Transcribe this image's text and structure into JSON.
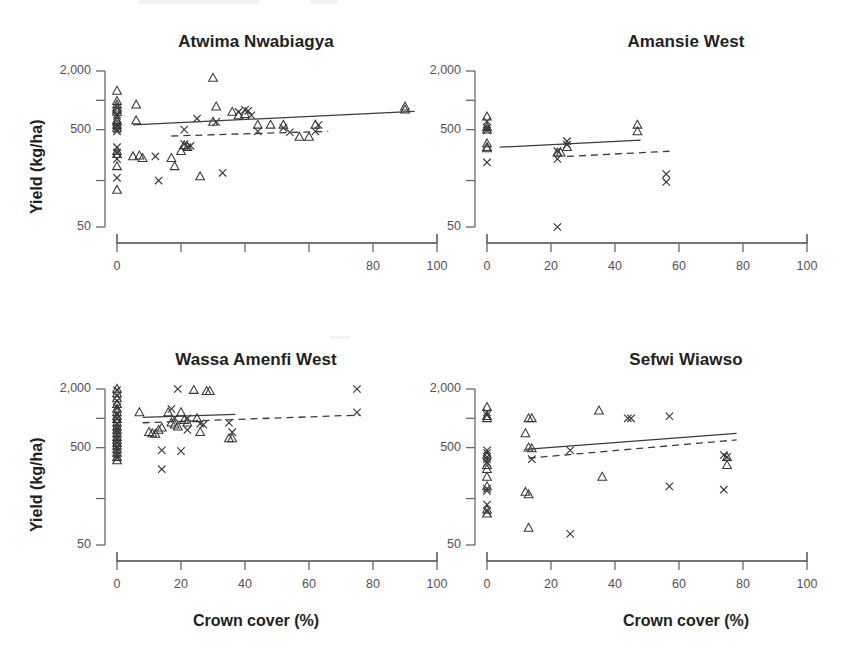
{
  "figure": {
    "axis_labels": {
      "y": "Yield (kg/ha)",
      "x": "Crown cover (%)"
    },
    "y_ticks": [
      {
        "value": 2000,
        "label": "2,000",
        "labeled": true
      },
      {
        "value": 1000,
        "label": "",
        "labeled": false
      },
      {
        "value": 500,
        "label": "500",
        "labeled": true
      },
      {
        "value": 150,
        "label": "",
        "labeled": false
      },
      {
        "value": 50,
        "label": "50",
        "labeled": true
      }
    ],
    "x_ticks": [
      0,
      20,
      40,
      60,
      80,
      100
    ],
    "legend_note": "",
    "colors": {
      "ink": "#3a3737",
      "axis": "#4a4646",
      "tick_text": "#555152",
      "title": "#231f20"
    }
  },
  "chart_data": [
    {
      "type": "scatter",
      "panel": 1,
      "title": "Atwima Nwabiagya",
      "xlabel": "",
      "ylabel": "Yield (kg/ha)",
      "xlim": [
        0,
        100
      ],
      "ylim": [
        50,
        2000
      ],
      "yscale": "log",
      "grid": false,
      "legend": "none",
      "x_tick_labels": [
        "0",
        "",
        "",
        "",
        "80",
        "100"
      ],
      "series": [
        {
          "name": "triangle",
          "marker": "triangle",
          "points": [
            [
              0,
              1250
            ],
            [
              0,
              980
            ],
            [
              0,
              900
            ],
            [
              0,
              840
            ],
            [
              0,
              800
            ],
            [
              0,
              760
            ],
            [
              0,
              620
            ],
            [
              0,
              600
            ],
            [
              0,
              560
            ],
            [
              0,
              520
            ],
            [
              0,
              300
            ],
            [
              0,
              280
            ],
            [
              0,
              210
            ],
            [
              0,
              120
            ],
            [
              6,
              900
            ],
            [
              6,
              620
            ],
            [
              5,
              265
            ],
            [
              7,
              270
            ],
            [
              8,
              255
            ],
            [
              17,
              255
            ],
            [
              18,
              210
            ],
            [
              21,
              345
            ],
            [
              22,
              330
            ],
            [
              20,
              300
            ],
            [
              26,
              165
            ],
            [
              30,
              600
            ],
            [
              30,
              1700
            ],
            [
              31,
              860
            ],
            [
              36,
              760
            ],
            [
              38,
              700
            ],
            [
              40,
              720
            ],
            [
              44,
              560
            ],
            [
              48,
              560
            ],
            [
              52,
              560
            ],
            [
              57,
              420
            ],
            [
              60,
              420
            ],
            [
              62,
              560
            ],
            [
              90,
              860
            ],
            [
              90,
              800
            ]
          ]
        },
        {
          "name": "cross",
          "marker": "cross",
          "points": [
            [
              0,
              720
            ],
            [
              0,
              690
            ],
            [
              0,
              560
            ],
            [
              0,
              540
            ],
            [
              0,
              500
            ],
            [
              0,
              480
            ],
            [
              0,
              330
            ],
            [
              0,
              290
            ],
            [
              0,
              250
            ],
            [
              0,
              160
            ],
            [
              12,
              265
            ],
            [
              13,
              150
            ],
            [
              21,
              500
            ],
            [
              21,
              355
            ],
            [
              22,
              330
            ],
            [
              23,
              340
            ],
            [
              25,
              650
            ],
            [
              31,
              600
            ],
            [
              33,
              180
            ],
            [
              38,
              760
            ],
            [
              40,
              800
            ],
            [
              41,
              780
            ],
            [
              42,
              700
            ],
            [
              44,
              480
            ],
            [
              52,
              520
            ],
            [
              54,
              470
            ],
            [
              62,
              480
            ],
            [
              63,
              560
            ]
          ]
        }
      ],
      "fit_lines": [
        {
          "style": "solid",
          "x": [
            5,
            93
          ],
          "y": [
            560,
            770
          ]
        },
        {
          "style": "dashed",
          "x": [
            17,
            66
          ],
          "y": [
            430,
            480
          ]
        }
      ]
    },
    {
      "type": "scatter",
      "panel": 2,
      "title": "Amansie West",
      "xlabel": "",
      "ylabel": "",
      "xlim": [
        0,
        100
      ],
      "ylim": [
        50,
        2000
      ],
      "yscale": "log",
      "grid": false,
      "legend": "none",
      "x_tick_labels": [
        "0",
        "20",
        "40",
        "60",
        "80",
        "100"
      ],
      "series": [
        {
          "name": "triangle",
          "marker": "triangle",
          "points": [
            [
              0,
              680
            ],
            [
              0,
              530
            ],
            [
              0,
              500
            ],
            [
              0,
              360
            ],
            [
              0,
              330
            ],
            [
              0,
              320
            ],
            [
              22,
              290
            ],
            [
              23,
              290
            ],
            [
              25,
              330
            ],
            [
              47,
              560
            ],
            [
              47,
              480
            ]
          ]
        },
        {
          "name": "cross",
          "marker": "cross",
          "points": [
            [
              0,
              610
            ],
            [
              0,
              520
            ],
            [
              0,
              490
            ],
            [
              0,
              230
            ],
            [
              22,
              300
            ],
            [
              22,
              250
            ],
            [
              25,
              380
            ],
            [
              25,
              350
            ],
            [
              56,
              175
            ],
            [
              56,
              145
            ],
            [
              22,
              50
            ]
          ]
        }
      ],
      "fit_lines": [
        {
          "style": "solid",
          "x": [
            4,
            48
          ],
          "y": [
            330,
            390
          ]
        },
        {
          "style": "dashed",
          "x": [
            25,
            57
          ],
          "y": [
            265,
            300
          ]
        }
      ]
    },
    {
      "type": "scatter",
      "panel": 3,
      "title": "Wassa Amenfi West",
      "xlabel": "Crown cover (%)",
      "ylabel": "Yield (kg/ha)",
      "xlim": [
        0,
        100
      ],
      "ylim": [
        50,
        2000
      ],
      "yscale": "log",
      "grid": false,
      "legend": "none",
      "x_tick_labels": [
        "0",
        "20",
        "40",
        "60",
        "80",
        "100"
      ],
      "series": [
        {
          "name": "triangle",
          "marker": "triangle",
          "points": [
            [
              0,
              2000
            ],
            [
              0,
              1800
            ],
            [
              0,
              1600
            ],
            [
              0,
              1400
            ],
            [
              0,
              1250
            ],
            [
              0,
              1150
            ],
            [
              0,
              1050
            ],
            [
              0,
              980
            ],
            [
              0,
              900
            ],
            [
              0,
              820
            ],
            [
              0,
              760
            ],
            [
              0,
              700
            ],
            [
              0,
              640
            ],
            [
              0,
              600
            ],
            [
              0,
              560
            ],
            [
              0,
              520
            ],
            [
              0,
              480
            ],
            [
              0,
              440
            ],
            [
              0,
              400
            ],
            [
              0,
              370
            ],
            [
              7,
              1150
            ],
            [
              10,
              720
            ],
            [
              11,
              700
            ],
            [
              12,
              690
            ],
            [
              13,
              760
            ],
            [
              14,
              800
            ],
            [
              16,
              1150
            ],
            [
              17,
              900
            ],
            [
              18,
              860
            ],
            [
              19,
              820
            ],
            [
              20,
              1150
            ],
            [
              21,
              960
            ],
            [
              22,
              900
            ],
            [
              24,
              1950
            ],
            [
              25,
              1000
            ],
            [
              26,
              720
            ],
            [
              28,
              1900
            ],
            [
              29,
              1900
            ],
            [
              35,
              620
            ],
            [
              36,
              620
            ]
          ]
        },
        {
          "name": "cross",
          "marker": "cross",
          "points": [
            [
              0,
              1950
            ],
            [
              0,
              1700
            ],
            [
              0,
              1500
            ],
            [
              0,
              1300
            ],
            [
              0,
              1100
            ],
            [
              0,
              1000
            ],
            [
              0,
              880
            ],
            [
              0,
              800
            ],
            [
              0,
              740
            ],
            [
              0,
              680
            ],
            [
              0,
              620
            ],
            [
              0,
              560
            ],
            [
              0,
              500
            ],
            [
              0,
              460
            ],
            [
              0,
              420
            ],
            [
              0,
              390
            ],
            [
              14,
              470
            ],
            [
              14,
              300
            ],
            [
              17,
              1250
            ],
            [
              18,
              1000
            ],
            [
              19,
              2000
            ],
            [
              20,
              460
            ],
            [
              22,
              1000
            ],
            [
              22,
              760
            ],
            [
              26,
              880
            ],
            [
              27,
              860
            ],
            [
              35,
              900
            ],
            [
              36,
              720
            ],
            [
              75,
              2000
            ],
            [
              75,
              1150
            ]
          ]
        }
      ],
      "fit_lines": [
        {
          "style": "solid",
          "x": [
            8,
            37
          ],
          "y": [
            1020,
            1100
          ]
        },
        {
          "style": "dashed",
          "x": [
            8,
            76
          ],
          "y": [
            900,
            1080
          ]
        }
      ]
    },
    {
      "type": "scatter",
      "panel": 4,
      "title": "Sefwi Wiawso",
      "xlabel": "Crown cover (%)",
      "ylabel": "",
      "xlim": [
        0,
        100
      ],
      "ylim": [
        50,
        2000
      ],
      "yscale": "log",
      "grid": false,
      "legend": "none",
      "x_tick_labels": [
        "0",
        "20",
        "40",
        "60",
        "80",
        "100"
      ],
      "series": [
        {
          "name": "triangle",
          "marker": "triangle",
          "points": [
            [
              0,
              1300
            ],
            [
              0,
              1050
            ],
            [
              0,
              1000
            ],
            [
              0,
              420
            ],
            [
              0,
              330
            ],
            [
              0,
              300
            ],
            [
              0,
              250
            ],
            [
              0,
              200
            ],
            [
              0,
              115
            ],
            [
              0,
              105
            ],
            [
              13,
              1000
            ],
            [
              14,
              1000
            ],
            [
              12,
              700
            ],
            [
              13,
              500
            ],
            [
              14,
              490
            ],
            [
              12,
              175
            ],
            [
              13,
              165
            ],
            [
              13,
              75
            ],
            [
              35,
              1200
            ],
            [
              36,
              250
            ],
            [
              75,
              400
            ],
            [
              75,
              330
            ]
          ]
        },
        {
          "name": "cross",
          "marker": "cross",
          "points": [
            [
              0,
              1150
            ],
            [
              0,
              1080
            ],
            [
              0,
              470
            ],
            [
              0,
              440
            ],
            [
              0,
              400
            ],
            [
              0,
              380
            ],
            [
              0,
              350
            ],
            [
              0,
              190
            ],
            [
              0,
              180
            ],
            [
              0,
              130
            ],
            [
              0,
              110
            ],
            [
              14,
              380
            ],
            [
              26,
              470
            ],
            [
              26,
              65
            ],
            [
              44,
              1000
            ],
            [
              45,
              1000
            ],
            [
              57,
              1050
            ],
            [
              57,
              200
            ],
            [
              74,
              185
            ],
            [
              74,
              420
            ],
            [
              75,
              400
            ]
          ]
        }
      ],
      "fit_lines": [
        {
          "style": "solid",
          "x": [
            12,
            78
          ],
          "y": [
            480,
            700
          ]
        },
        {
          "style": "dashed",
          "x": [
            13,
            78
          ],
          "y": [
            390,
            600
          ]
        }
      ]
    }
  ]
}
